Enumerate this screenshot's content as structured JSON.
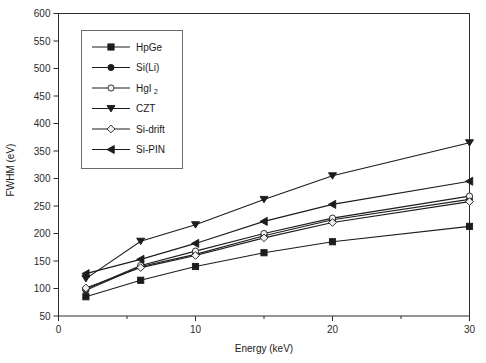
{
  "chart_data": {
    "type": "line",
    "title": "",
    "xlabel": "Energy (keV)",
    "ylabel": "FWHM (eV)",
    "xlim": [
      0,
      30
    ],
    "ylim": [
      50,
      600
    ],
    "xticks": [
      0,
      10,
      20,
      30
    ],
    "xticklabels": [
      "0",
      "10",
      "20",
      "30"
    ],
    "xminorticks": [
      5,
      15,
      25
    ],
    "yticks": [
      50,
      100,
      150,
      200,
      250,
      300,
      350,
      400,
      450,
      500,
      550,
      600
    ],
    "yticklabels": [
      "50",
      "100",
      "150",
      "200",
      "250",
      "300",
      "350",
      "400",
      "450",
      "500",
      "550",
      "600"
    ],
    "grid": false,
    "legend_position": "upper left",
    "x": [
      2,
      6,
      10,
      15,
      20,
      30
    ],
    "series": [
      {
        "name": "HpGe",
        "label": "HpGe",
        "marker": "filled-square",
        "values": [
          85,
          115,
          140,
          165,
          185,
          213
        ]
      },
      {
        "name": "Si(Li)",
        "label": "Si(Li)",
        "marker": "filled-circle",
        "values": [
          97,
          140,
          162,
          196,
          225,
          262
        ]
      },
      {
        "name": "HgI2",
        "label": "HgI",
        "label_sub": "2",
        "marker": "open-circle",
        "values": [
          99,
          142,
          168,
          200,
          228,
          268
        ]
      },
      {
        "name": "CZT",
        "label": "CZT",
        "marker": "filled-down-triangle",
        "values": [
          118,
          186,
          216,
          262,
          305,
          365
        ]
      },
      {
        "name": "Si-drift",
        "label": "Si-drift",
        "marker": "open-diamond",
        "values": [
          101,
          138,
          160,
          192,
          220,
          258
        ]
      },
      {
        "name": "Si-PIN",
        "label": "Si-PIN",
        "marker": "filled-left-triangle",
        "values": [
          127,
          153,
          182,
          222,
          253,
          295
        ]
      }
    ]
  },
  "colors": {
    "ink": "#1c1c1c",
    "axis": "#2b2b2b",
    "legend_border": "#6b6b6b",
    "background": "#ffffff"
  }
}
